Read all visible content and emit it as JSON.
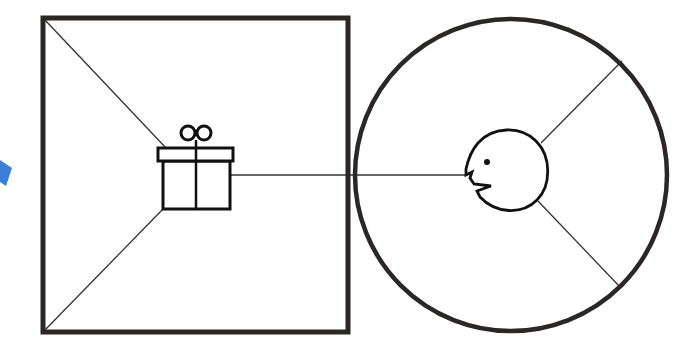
{
  "diagram": {
    "title": "",
    "canvas": {
      "width": 697,
      "height": 355,
      "background": "#ffffff"
    },
    "colors": {
      "frame_stroke": "#2b2727",
      "line_stroke": "#333333",
      "icon_stroke": "#111111",
      "accent_blue": "#3b7fd9"
    },
    "square_room": {
      "x": 43,
      "y": 18,
      "width": 305,
      "height": 314,
      "stroke_width": 5
    },
    "circle_room": {
      "cx": 511,
      "cy": 175,
      "r": 156,
      "stroke_width": 4.5
    },
    "gift_icon": {
      "semantic": "gift-icon",
      "lid": {
        "x": 158,
        "y": 148,
        "width": 75,
        "height": 13
      },
      "body": {
        "x": 163,
        "y": 161,
        "width": 67,
        "height": 48
      },
      "ribbon_x": 196,
      "bow_left": {
        "cx": 188,
        "cy": 133,
        "r": 7
      },
      "bow_right": {
        "cx": 204,
        "cy": 133,
        "r": 7
      }
    },
    "face_icon": {
      "semantic": "face-profile-icon",
      "eye": {
        "cx": 487,
        "cy": 162,
        "r": 3
      }
    },
    "connectors": [
      {
        "name": "square-top-left-to-gift",
        "x1": 45,
        "y1": 20,
        "x2": 166,
        "y2": 148
      },
      {
        "name": "square-bottom-left-to-gift",
        "x1": 45,
        "y1": 330,
        "x2": 163,
        "y2": 209
      },
      {
        "name": "gift-to-face",
        "x1": 230,
        "y1": 175,
        "x2": 466,
        "y2": 175
      },
      {
        "name": "face-to-circle-upper-right",
        "x1": 541,
        "y1": 143,
        "x2": 622,
        "y2": 61
      },
      {
        "name": "face-to-circle-lower-right",
        "x1": 538,
        "y1": 201,
        "x2": 620,
        "y2": 287
      }
    ],
    "blue_arrow_fragment": {
      "semantic": "arrow-icon",
      "visible": "partial, clipped at left edge"
    }
  }
}
